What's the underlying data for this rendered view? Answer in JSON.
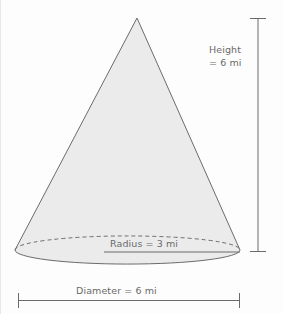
{
  "figure": {
    "shape_name": "cone",
    "title": "",
    "background_color": "#fdfdfd",
    "fill_color": "#ebebec",
    "stroke_color": "#6b6b6b",
    "text_color": "#6a6a6a"
  },
  "labels": {
    "height_line1": "Height",
    "height_line2": "= 6 mi",
    "radius": "Radius = 3 mi",
    "diameter": "Diameter = 6 mi"
  },
  "measurements": {
    "height_value": "6",
    "height_unit": "mi",
    "radius_value": "3",
    "radius_unit": "mi",
    "diameter_value": "6",
    "diameter_unit": "mi"
  }
}
